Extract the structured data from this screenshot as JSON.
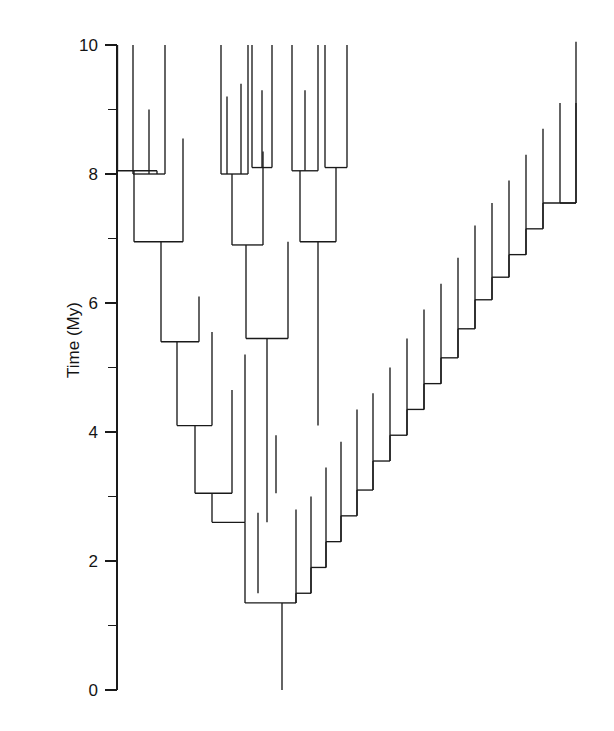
{
  "figure": {
    "type": "phylogenetic-tree",
    "axis": {
      "label": "Time (My)",
      "orientation": "vertical",
      "major_ticks": [
        "10",
        "8",
        "6",
        "4",
        "2",
        "0"
      ],
      "major_values": [
        10,
        8,
        6,
        4,
        2,
        0
      ],
      "minor_values": [
        9,
        7,
        5,
        3,
        1
      ],
      "range": [
        0,
        10
      ],
      "units": "My",
      "top_pixel": 45,
      "bottom_pixel": 690,
      "axis_x": 117
    },
    "line_color": "#1a1a1a",
    "background": "#ffffff"
  },
  "chart_data": {
    "type": "tree",
    "title": "",
    "xlabel": "",
    "ylabel": "Time (My)",
    "ylim": [
      0,
      10
    ],
    "grid": false,
    "legend": null,
    "tip_times": [
      10,
      10,
      9,
      10,
      10,
      10,
      10,
      9.2,
      9.4,
      10,
      10,
      9.3,
      10.1,
      9.1,
      8.7,
      8.3,
      7.9,
      7.5,
      6.7,
      6.3,
      5.9,
      5.45,
      5.0,
      4.6,
      4.25,
      3.8,
      3.4,
      2.95,
      2.55,
      2.1,
      1.5,
      2.75,
      5.2,
      7.2,
      6.4
    ],
    "node_times": [
      8.05,
      8.0,
      7.0,
      6.95,
      6.9,
      5.45,
      5.4,
      4.1,
      3.05,
      2.6,
      1.35,
      1.5,
      1.9,
      2.3,
      2.7,
      3.1,
      3.55,
      3.95,
      4.35,
      4.75,
      5.15,
      5.6,
      6.05,
      6.4,
      6.75,
      7.15,
      7.55
    ],
    "root_time": 0,
    "n_tips": 35,
    "branches": [
      {
        "x": 133,
        "y1": 45,
        "y2": 173
      },
      {
        "x": 165,
        "y1": 45,
        "y2": 167
      },
      {
        "x": 149,
        "y1": 110,
        "y2": 173
      },
      {
        "x": 117.5,
        "y1": 173,
        "y2": 238
      },
      {
        "x": 149,
        "y1": 173,
        "y2": 173
      },
      {
        "x": 157,
        "y1": 167,
        "y2": 238
      },
      {
        "x": 183,
        "y1": 173,
        "y2": 238
      },
      {
        "x": 221,
        "y1": 45,
        "y2": 200
      },
      {
        "x": 232,
        "y1": 45,
        "y2": 207
      },
      {
        "x": 227,
        "y1": 200,
        "y2": 207
      },
      {
        "x": 248,
        "y1": 45,
        "y2": 200
      },
      {
        "x": 260,
        "y1": 45,
        "y2": 212
      },
      {
        "x": 254,
        "y1": 200,
        "y2": 212
      }
    ]
  }
}
